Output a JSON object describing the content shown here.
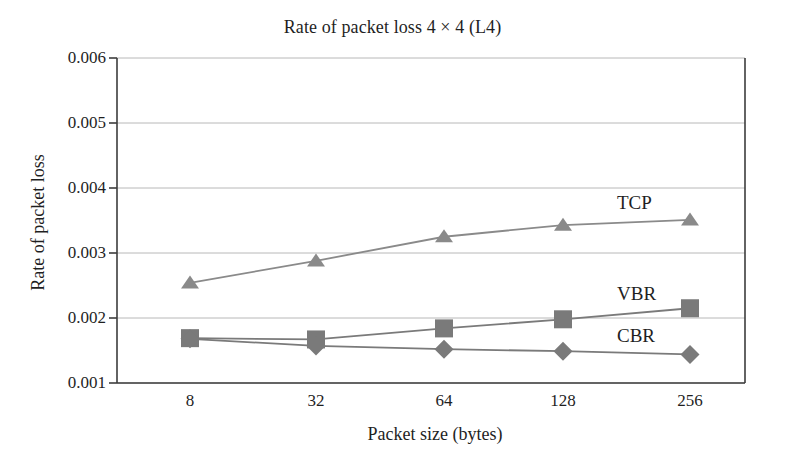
{
  "chart_data": {
    "type": "line",
    "title": "Rate of packet loss 4 × 4 (L4)",
    "xlabel": "Packet size (bytes)",
    "ylabel": "Rate of packet loss",
    "categories": [
      "8",
      "32",
      "64",
      "128",
      "256"
    ],
    "ylim": [
      0.001,
      0.006
    ],
    "yticks": [
      "0.006",
      "0.005",
      "0.004",
      "0.003",
      "0.002",
      "0.001"
    ],
    "ytick_values": [
      0.006,
      0.005,
      0.004,
      0.003,
      0.002,
      0.001
    ],
    "grid": "horizontal",
    "legend_position": "inline-right",
    "series": [
      {
        "name": "TCP",
        "marker": "triangle",
        "color": "#8a8a8a",
        "values": [
          0.00254,
          0.00288,
          0.00325,
          0.00343,
          0.00351
        ]
      },
      {
        "name": "VBR",
        "marker": "square",
        "color": "#7a7a7a",
        "values": [
          0.00169,
          0.00167,
          0.00184,
          0.00198,
          0.00215
        ]
      },
      {
        "name": "CBR",
        "marker": "diamond",
        "color": "#7a7a7a",
        "values": [
          0.00168,
          0.00157,
          0.00152,
          0.00149,
          0.00144
        ]
      }
    ]
  },
  "axis": {
    "line_color": "#3d3d3d",
    "grid_color": "#b8b8b8"
  }
}
